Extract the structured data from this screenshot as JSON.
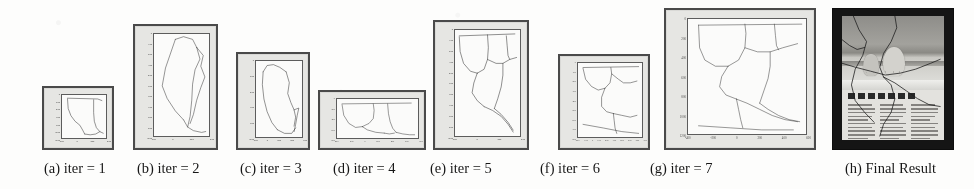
{
  "figure": {
    "kind": "scanned-paper-figure",
    "panel_count": 8,
    "colors": {
      "page_background": "#fdfdfc",
      "panel_border": "#4a4a4a",
      "axes_background": "#e6e6e3",
      "plot_background": "#fbfbfa",
      "curve_stroke": "#3a3a3a",
      "photo_frame": "#151515",
      "caption_text": "#161616"
    },
    "panels": [
      {
        "id": "a",
        "caption": "(a) iter = 1",
        "caption_x": 44,
        "x": 42,
        "y": 86,
        "w": 72,
        "h": 64,
        "plot": {
          "left": 16,
          "top": 5,
          "right": 4,
          "bottom": 8
        },
        "yticks": [
          "0",
          "200",
          "400",
          "600",
          "800",
          "1000",
          "1200"
        ],
        "xticks": [
          "-200",
          "0",
          "200",
          "400"
        ],
        "tick_font": 2.6,
        "curves": [
          "M 8 4 L 52 5 L 58 7",
          "M 8 5 L 9 17 L 13 26 L 19 33 L 26 38 L 30 44 L 33 49",
          "M 33 49 L 41 50 L 49 49 L 55 46",
          "M 46 6 L 46 22 L 47 33 L 50 41 L 55 46 L 60 48"
        ]
      },
      {
        "id": "b",
        "caption": "(b) iter = 2",
        "caption_x": 137,
        "x": 133,
        "y": 24,
        "w": 85,
        "h": 126,
        "plot": {
          "left": 17,
          "top": 6,
          "right": 5,
          "bottom": 10
        },
        "yticks": [
          "0",
          "100",
          "200",
          "300",
          "400",
          "500",
          "600",
          "700",
          "800",
          "900",
          "1000"
        ],
        "xticks": [
          "-200",
          "0",
          "200",
          "400"
        ],
        "tick_font": 2.6,
        "curves": [
          "M 26 6 L 36 3 L 47 6 L 52 15",
          "M 26 6 L 14 38 L 10 58 L 16 72 L 26 86 L 36 96",
          "M 52 15 L 56 28 L 50 40 L 47 56 L 46 74 L 44 92 L 41 104",
          "M 52 15 L 60 24 L 57 36 L 62 48 L 57 60 L 52 74 L 48 90 L 44 100",
          "M 36 96 L 41 104 L 48 108 L 58 110 L 63 109"
        ]
      },
      {
        "id": "c",
        "caption": "(c) iter = 3",
        "caption_x": 240,
        "x": 236,
        "y": 52,
        "w": 74,
        "h": 98,
        "plot": {
          "left": 16,
          "top": 5,
          "right": 4,
          "bottom": 9
        },
        "yticks": [
          "0",
          "200",
          "400",
          "600",
          "800",
          "1000"
        ],
        "xticks": [
          "-200",
          "0",
          "200",
          "400",
          "600"
        ],
        "tick_font": 2.6,
        "curves": [
          "M 9 12 L 14 5 L 22 4 L 30 7 L 38 12",
          "M 9 12 L 8 26 L 10 42 L 14 56 L 20 68 L 27 76",
          "M 38 12 L 42 24 L 40 36 L 44 46 L 48 54 L 50 62 L 48 72",
          "M 27 76 L 36 80 L 45 80 L 50 74",
          "M 48 54 L 54 52 L 52 60 L 50 70 L 48 78"
        ]
      },
      {
        "id": "d",
        "caption": "(d) iter = 4",
        "caption_x": 333,
        "x": 318,
        "y": 90,
        "w": 108,
        "h": 60,
        "plot": {
          "left": 15,
          "top": 5,
          "right": 4,
          "bottom": 8
        },
        "yticks": [
          "0",
          "200",
          "400",
          "600",
          "800"
        ],
        "xticks": [
          "-400",
          "-200",
          "0",
          "200",
          "400",
          "600",
          "800"
        ],
        "tick_font": 2.4,
        "curves": [
          "M 6 6 L 88 5",
          "M 6 7 L 8 20 L 14 30 L 22 35 L 30 34",
          "M 30 34 L 38 30 L 43 24 L 44 14 L 43 6",
          "M 30 34 L 36 38 L 46 41 L 56 42",
          "M 60 6 L 61 18 L 63 28 L 66 36 L 70 41",
          "M 70 41 L 78 43 L 86 44 L 92 44",
          "M 56 42 L 62 43 L 68 42"
        ]
      },
      {
        "id": "e",
        "caption": "(e) iter = 5",
        "caption_x": 430,
        "x": 433,
        "y": 20,
        "w": 96,
        "h": 130,
        "plot": {
          "left": 18,
          "top": 6,
          "right": 5,
          "bottom": 10
        },
        "yticks": [
          "0",
          "100",
          "200",
          "300",
          "400",
          "500",
          "600",
          "700",
          "800",
          "900",
          "1000"
        ],
        "xticks": [
          "-200",
          "0",
          "200",
          "400"
        ],
        "tick_font": 2.6,
        "curves": [
          "M 5 6 L 70 4",
          "M 5 7 L 6 22 L 10 34 L 18 42 L 26 44",
          "M 26 44 L 34 40 L 38 30 L 39 18 L 38 5",
          "M 26 44 L 22 54 L 20 64 L 26 72 L 34 78",
          "M 34 78 L 44 82 L 54 88 L 62 96 L 68 104",
          "M 38 30 L 48 34 L 56 34 L 64 30 L 72 28",
          "M 56 34 L 56 46 L 54 58 L 50 70 L 46 80",
          "M 60 6 L 61 16 L 62 26 L 64 30",
          "M 46 80 L 54 86 L 62 94 L 68 102"
        ]
      },
      {
        "id": "f",
        "caption": "(f) iter = 6",
        "caption_x": 540,
        "x": 558,
        "y": 54,
        "w": 92,
        "h": 96,
        "plot": {
          "left": 16,
          "top": 5,
          "right": 4,
          "bottom": 9
        },
        "yticks": [
          "0",
          "100",
          "200",
          "300",
          "400",
          "500",
          "600",
          "700",
          "800"
        ],
        "xticks": [
          "-200",
          "-100",
          "0",
          "100",
          "200",
          "300",
          "400",
          "500",
          "600",
          "700"
        ],
        "tick_font": 2.4,
        "curves": [
          "M 6 5 L 72 4",
          "M 6 6 L 9 18 L 16 26 L 24 30 L 32 28",
          "M 32 28 L 38 22 L 40 12 L 39 5",
          "M 32 28 L 28 38 L 28 48 L 34 54 L 42 56",
          "M 42 56 L 52 58 L 62 60 L 70 58",
          "M 40 12 L 48 18 L 54 22 L 62 22 L 70 20",
          "M 42 56 L 43 64 L 44 72 L 46 78",
          "M 6 68 L 30 72 L 52 76 L 72 78"
        ]
      },
      {
        "id": "g",
        "caption": "(g) iter = 7",
        "caption_x": 650,
        "x": 664,
        "y": 8,
        "w": 152,
        "h": 142,
        "plot": {
          "left": 20,
          "top": 7,
          "right": 6,
          "bottom": 12
        },
        "yticks": [
          "0",
          "200",
          "400",
          "600",
          "800",
          "1000",
          "1200"
        ],
        "xticks": [
          "-400",
          "-200",
          "0",
          "200",
          "400",
          "600"
        ],
        "tick_font": 3.1,
        "curves": [
          "M 10 6 L 108 5",
          "M 10 6 L 11 28 L 16 40 L 26 46 L 38 46",
          "M 38 46 L 48 40 L 54 28 L 55 14 L 54 5",
          "M 38 46 L 32 56 L 30 66 L 36 74 L 46 78",
          "M 46 78 L 56 82 L 68 88 L 80 94 L 92 98 L 104 100",
          "M 54 28 L 66 32 L 78 32 L 90 28 L 104 24",
          "M 78 32 L 78 46 L 76 58 L 72 70 L 68 82",
          "M 82 5 L 83 16 L 84 26 L 86 30",
          "M 68 82 L 76 88 L 86 94 L 96 98 L 106 100",
          "M 10 104 L 40 106 L 70 108 L 100 108",
          "M 46 78 L 48 88 L 50 98 L 52 106"
        ]
      },
      {
        "id": "h",
        "caption": "(h) Final Result",
        "caption_x": 845,
        "x": 832,
        "y": 8,
        "w": 122,
        "h": 142,
        "photo": {
          "subject": "two polar bears on snow / ice, newspaper page",
          "headline_visible": false,
          "cracks": [
            "M 12 0 L 18 14 L 26 26 L 22 40 L 14 54 L 10 70 L 14 86 L 24 98 L 34 108",
            "M 56 0 L 58 12 L 52 26 L 44 38 L 40 52 L 44 62 L 52 70 L 56 84 L 52 98 L 44 110 L 40 122",
            "M 0 48 L 14 52 L 30 56 L 46 60 L 62 58 L 78 54 L 94 48 L 104 44",
            "M 44 62 L 56 68 L 68 76 L 80 84 L 92 90 L 104 92",
            "M 0 24 L 8 30 L 16 34 L 24 32"
          ]
        }
      }
    ]
  }
}
